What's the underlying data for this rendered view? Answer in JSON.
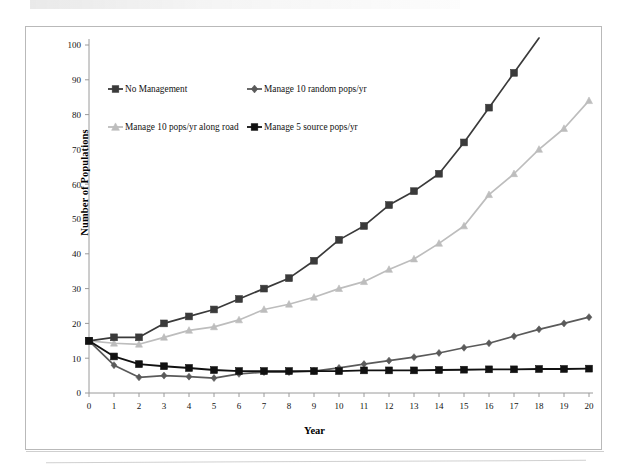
{
  "chart_data": {
    "type": "line",
    "title": "",
    "xlabel": "Year",
    "ylabel": "Number of Populations",
    "xlim": [
      0,
      20
    ],
    "ylim": [
      0,
      100
    ],
    "xticks": [
      0,
      1,
      2,
      3,
      4,
      5,
      6,
      7,
      8,
      9,
      10,
      11,
      12,
      13,
      14,
      15,
      16,
      17,
      18,
      19,
      20
    ],
    "yticks": [
      0,
      10,
      20,
      30,
      40,
      50,
      60,
      70,
      80,
      90,
      100
    ],
    "grid": false,
    "legend_position": "top-left-inside",
    "x": [
      0,
      1,
      2,
      3,
      4,
      5,
      6,
      7,
      8,
      9,
      10,
      11,
      12,
      13,
      14,
      15,
      16,
      17,
      18,
      19,
      20
    ],
    "series": [
      {
        "name": "No Management",
        "marker": "square",
        "color": "#3a3a3a",
        "values": [
          15,
          16,
          16,
          20,
          22,
          24,
          27,
          30,
          33,
          38,
          44,
          48,
          54,
          58,
          63,
          72,
          82,
          92,
          102,
          null,
          null
        ]
      },
      {
        "name": "Manage 10 random pops/yr",
        "marker": "diamond",
        "color": "#5a5a5a",
        "values": [
          15,
          8,
          4.5,
          5,
          4.7,
          4.3,
          5.5,
          6,
          6,
          6.3,
          7.2,
          8.3,
          9.3,
          10.3,
          11.5,
          13,
          14.3,
          16.3,
          18.3,
          20,
          21.8
        ]
      },
      {
        "name": "Manage 10 pops/yr along road",
        "marker": "triangle",
        "color": "#bdbdbd",
        "values": [
          15,
          14.3,
          14,
          16,
          18,
          19,
          21,
          24,
          25.5,
          27.5,
          30,
          32,
          35.5,
          38.5,
          43,
          48,
          57,
          63,
          70,
          76,
          84
        ]
      },
      {
        "name": "Manage 5 source pops/yr",
        "marker": "square",
        "color": "#111111",
        "values": [
          15,
          10.5,
          8.3,
          7.7,
          7.2,
          6.6,
          6.3,
          6.3,
          6.3,
          6.3,
          6.3,
          6.5,
          6.5,
          6.5,
          6.6,
          6.7,
          6.8,
          6.8,
          6.9,
          6.9,
          7
        ]
      }
    ],
    "legend": [
      {
        "label": "No Management",
        "marker": "square",
        "color": "#3a3a3a"
      },
      {
        "label": "Manage 10 random pops/yr",
        "marker": "diamond",
        "color": "#5a5a5a"
      },
      {
        "label": "Manage 10 pops/yr along road",
        "marker": "triangle",
        "color": "#bdbdbd"
      },
      {
        "label": "Manage 5 source pops/yr",
        "marker": "square",
        "color": "#111111"
      }
    ]
  }
}
